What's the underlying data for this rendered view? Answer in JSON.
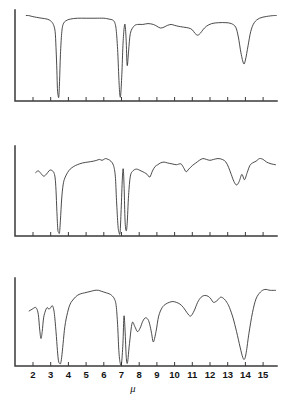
{
  "figure": {
    "panel_count": 3,
    "axis_label": "μ",
    "tick_labels": [
      "2",
      "3",
      "4",
      "5",
      "6",
      "7",
      "8",
      "9",
      "10",
      "11",
      "12",
      "13",
      "14",
      "15"
    ],
    "line_color": "#2b2b2b",
    "axis_color": "#3a3a3a",
    "background_color": "#ffffff"
  },
  "chart_data": [
    {
      "type": "line",
      "title": "Spectrum A (top panel)",
      "xlabel": "μ",
      "ylabel": "Transmittance",
      "xlim": [
        1.6,
        15.8
      ],
      "ylim": [
        0,
        100
      ],
      "grid": false,
      "legend": "none",
      "tick_labels": [
        "2",
        "3",
        "4",
        "5",
        "6",
        "7",
        "8",
        "9",
        "10",
        "11",
        "12",
        "13",
        "14",
        "15"
      ],
      "x": [
        1.62,
        1.75,
        1.95,
        2.2,
        2.5,
        2.8,
        3.0,
        3.15,
        3.25,
        3.3,
        3.35,
        3.38,
        3.42,
        3.46,
        3.5,
        3.55,
        3.62,
        3.7,
        3.85,
        4.1,
        4.5,
        5.0,
        5.5,
        6.0,
        6.3,
        6.5,
        6.62,
        6.7,
        6.78,
        6.85,
        6.9,
        6.95,
        7.02,
        7.08,
        7.14,
        7.2,
        7.26,
        7.32,
        7.4,
        7.5,
        7.7,
        7.9,
        8.2,
        8.5,
        8.8,
        9.0,
        9.2,
        9.4,
        9.6,
        9.8,
        10.0,
        10.2,
        10.5,
        10.8,
        11.0,
        11.15,
        11.3,
        11.45,
        11.6,
        11.8,
        12.1,
        12.5,
        12.9,
        13.2,
        13.45,
        13.6,
        13.75,
        13.9,
        14.0,
        14.15,
        14.3,
        14.5,
        14.8,
        15.2,
        15.6,
        15.75
      ],
      "y": [
        96,
        96,
        95,
        94,
        93,
        92,
        90,
        86,
        78,
        60,
        34,
        14,
        6,
        5,
        22,
        52,
        76,
        86,
        90,
        92,
        93,
        93,
        93,
        93,
        92,
        91,
        88,
        80,
        58,
        26,
        8,
        6,
        30,
        62,
        80,
        86,
        70,
        40,
        56,
        76,
        84,
        86,
        86,
        87,
        86,
        84,
        82,
        83,
        85,
        86,
        85,
        84,
        83,
        82,
        80,
        76,
        74,
        76,
        80,
        84,
        87,
        88,
        88,
        87,
        83,
        72,
        54,
        42,
        46,
        62,
        78,
        88,
        93,
        95,
        96,
        96
      ],
      "peaks": [
        {
          "x": 3.42,
          "depth": "very strong",
          "label": "C-H stretch"
        },
        {
          "x": 6.9,
          "depth": "very strong"
        },
        {
          "x": 7.26,
          "depth": "strong"
        },
        {
          "x": 11.35,
          "depth": "weak"
        },
        {
          "x": 13.9,
          "depth": "strong"
        }
      ]
    },
    {
      "type": "line",
      "title": "Spectrum B (middle panel)",
      "xlabel": "μ",
      "ylabel": "Transmittance",
      "xlim": [
        1.6,
        15.8
      ],
      "ylim": [
        0,
        100
      ],
      "grid": false,
      "legend": "none",
      "tick_labels": [
        "2",
        "3",
        "4",
        "5",
        "6",
        "7",
        "8",
        "9",
        "10",
        "11",
        "12",
        "13",
        "14",
        "15"
      ],
      "x": [
        2.15,
        2.3,
        2.45,
        2.6,
        2.75,
        2.9,
        3.0,
        3.1,
        3.18,
        3.25,
        3.3,
        3.35,
        3.4,
        3.45,
        3.5,
        3.55,
        3.62,
        3.7,
        3.8,
        3.95,
        4.1,
        4.3,
        4.5,
        4.8,
        5.1,
        5.4,
        5.6,
        5.75,
        5.9,
        6.0,
        6.1,
        6.25,
        6.4,
        6.55,
        6.65,
        6.72,
        6.8,
        6.86,
        6.92,
        6.98,
        7.05,
        7.1,
        7.15,
        7.2,
        7.26,
        7.32,
        7.4,
        7.5,
        7.65,
        7.85,
        8.1,
        8.3,
        8.45,
        8.6,
        8.75,
        8.9,
        9.05,
        9.2,
        9.4,
        9.6,
        9.85,
        10.1,
        10.35,
        10.5,
        10.65,
        10.8,
        11.0,
        11.2,
        11.4,
        11.6,
        11.8,
        12.0,
        12.2,
        12.45,
        12.7,
        12.9,
        13.05,
        13.2,
        13.35,
        13.5,
        13.65,
        13.8,
        13.95,
        14.1,
        14.25,
        14.4,
        14.6,
        14.8,
        15.0,
        15.2,
        15.45,
        15.7
      ],
      "y": [
        72,
        74,
        71,
        68,
        70,
        74,
        75,
        74,
        72,
        66,
        52,
        28,
        8,
        4,
        4,
        18,
        42,
        58,
        66,
        72,
        76,
        79,
        81,
        83,
        84,
        85,
        86,
        87,
        86,
        87,
        88,
        87,
        85,
        80,
        68,
        40,
        12,
        4,
        4,
        30,
        66,
        76,
        54,
        18,
        6,
        14,
        46,
        68,
        74,
        76,
        74,
        72,
        70,
        67,
        74,
        79,
        81,
        83,
        84,
        83,
        82,
        81,
        82,
        78,
        73,
        76,
        80,
        83,
        86,
        88,
        87,
        86,
        87,
        88,
        87,
        84,
        78,
        70,
        62,
        58,
        62,
        70,
        64,
        72,
        80,
        83,
        85,
        88,
        87,
        84,
        82,
        81
      ],
      "peaks": [
        {
          "x": 3.45,
          "depth": "very strong"
        },
        {
          "x": 6.88,
          "depth": "very strong"
        },
        {
          "x": 7.22,
          "depth": "very strong"
        },
        {
          "x": 8.6,
          "depth": "medium"
        },
        {
          "x": 13.5,
          "depth": "strong"
        },
        {
          "x": 13.95,
          "depth": "medium"
        }
      ]
    },
    {
      "type": "line",
      "title": "Spectrum C (bottom panel)",
      "xlabel": "μ",
      "ylabel": "Transmittance",
      "xlim": [
        1.6,
        15.8
      ],
      "ylim": [
        0,
        100
      ],
      "grid": false,
      "legend": "none",
      "tick_labels": [
        "2",
        "3",
        "4",
        "5",
        "6",
        "7",
        "8",
        "9",
        "10",
        "11",
        "12",
        "13",
        "14",
        "15"
      ],
      "x": [
        1.78,
        1.95,
        2.1,
        2.2,
        2.3,
        2.38,
        2.45,
        2.52,
        2.6,
        2.7,
        2.8,
        2.9,
        3.0,
        3.1,
        3.2,
        3.3,
        3.38,
        3.44,
        3.5,
        3.56,
        3.62,
        3.7,
        3.8,
        3.95,
        4.1,
        4.3,
        4.5,
        4.7,
        4.9,
        5.1,
        5.3,
        5.5,
        5.7,
        5.85,
        6.0,
        6.15,
        6.3,
        6.45,
        6.6,
        6.7,
        6.78,
        6.85,
        6.92,
        7.0,
        7.08,
        7.14,
        7.2,
        7.27,
        7.34,
        7.45,
        7.6,
        7.75,
        7.9,
        8.05,
        8.2,
        8.35,
        8.5,
        8.6,
        8.7,
        8.8,
        8.95,
        9.1,
        9.3,
        9.5,
        9.7,
        9.9,
        10.1,
        10.3,
        10.5,
        10.7,
        10.9,
        11.1,
        11.3,
        11.5,
        11.7,
        11.9,
        12.05,
        12.2,
        12.4,
        12.6,
        12.8,
        12.95,
        13.1,
        13.3,
        13.5,
        13.7,
        13.85,
        13.95,
        14.05,
        14.2,
        14.4,
        14.6,
        14.85,
        15.1,
        15.4,
        15.7
      ],
      "y": [
        64,
        66,
        68,
        67,
        60,
        42,
        32,
        40,
        56,
        64,
        68,
        66,
        68,
        70,
        62,
        40,
        18,
        6,
        3,
        3,
        10,
        26,
        46,
        62,
        72,
        78,
        82,
        84,
        85,
        86,
        87,
        88,
        88,
        87,
        86,
        85,
        84,
        82,
        78,
        70,
        48,
        18,
        4,
        3,
        26,
        58,
        42,
        10,
        4,
        26,
        50,
        46,
        40,
        44,
        52,
        56,
        54,
        48,
        38,
        28,
        40,
        58,
        68,
        72,
        74,
        75,
        74,
        72,
        68,
        62,
        58,
        64,
        74,
        80,
        82,
        81,
        78,
        74,
        76,
        80,
        78,
        74,
        68,
        56,
        40,
        22,
        10,
        8,
        16,
        38,
        62,
        78,
        86,
        89,
        88,
        88
      ],
      "peaks": [
        {
          "x": 2.4,
          "depth": "medium"
        },
        {
          "x": 3.5,
          "depth": "very strong"
        },
        {
          "x": 7.0,
          "depth": "very strong"
        },
        {
          "x": 7.3,
          "depth": "very strong"
        },
        {
          "x": 8.8,
          "depth": "strong"
        },
        {
          "x": 10.9,
          "depth": "medium"
        },
        {
          "x": 13.9,
          "depth": "very strong"
        }
      ]
    }
  ]
}
